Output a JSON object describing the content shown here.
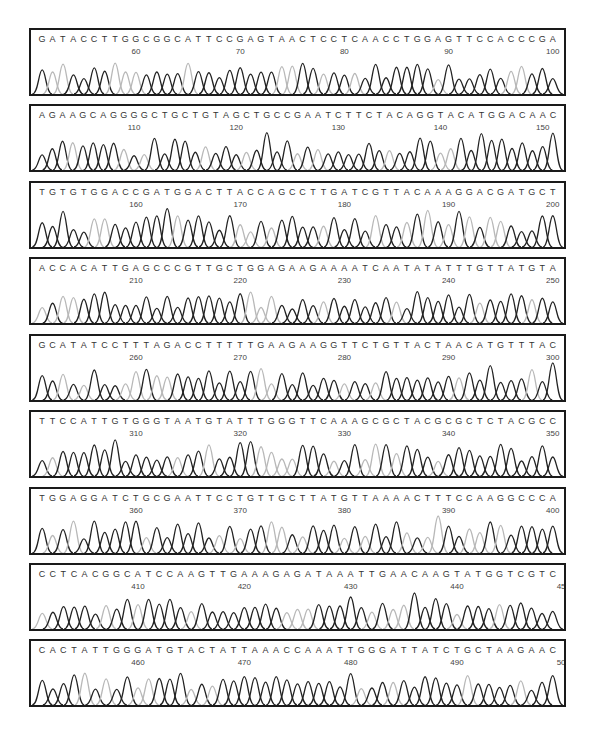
{
  "colors": {
    "dark_peak": "#222222",
    "light_peak": "#b8b8b8",
    "border": "#1a1a1a",
    "text": "#333333"
  },
  "rows": [
    {
      "seq": "GATACCTTGGCGGCATTCCGAGTAACTCCTCAACCTGGAGTTCCACCCGA",
      "ticks": [
        "60",
        "70",
        "80",
        "90",
        "100"
      ],
      "start": 51
    },
    {
      "seq": "AGAAGCAGGGGCTGCTGTAGCTGCCGAATCTTCTACAGGTACATGGACAAC",
      "ticks": [
        "110",
        "120",
        "130",
        "140",
        "150"
      ],
      "start": 101
    },
    {
      "seq": "TGTGTGGACCGATGGACTTACCAGCCTTGATCGTTACAAAGGACGATGCT",
      "ticks": [
        "160",
        "170",
        "180",
        "190",
        "200"
      ],
      "start": 151
    },
    {
      "seq": "ACCACATTGAGCCCGTTGCTGGAGAAGAAAATCAATATATTTGTTATGTA",
      "ticks": [
        "210",
        "220",
        "230",
        "240",
        "250"
      ],
      "start": 201
    },
    {
      "seq": "GCATATCCTTTAGACCTTTTTGAAGAAGGTTCTGTTACTAACATGTTTAC",
      "ticks": [
        "260",
        "270",
        "280",
        "290",
        "300"
      ],
      "start": 251
    },
    {
      "seq": "TTCCATTGTGGGTAATGTATTTGGGTTCAAAGCGCTACGCGCTCTACGCC",
      "ticks": [
        "310",
        "320",
        "330",
        "340",
        "350"
      ],
      "start": 301
    },
    {
      "seq": "TGGAGGATCTGCGAATTCCTGTTGCTTATGTTAAAACTTTCCAAGGCCCA",
      "ticks": [
        "360",
        "370",
        "380",
        "390",
        "400"
      ],
      "start": 351
    },
    {
      "seq": "CCTCACGGCATCCAAGTTGAAAGAGATAAATTGAACAAGTATGGTCGTC",
      "ticks": [
        "410",
        "420",
        "430",
        "440",
        "450"
      ],
      "start": 401
    },
    {
      "seq": "CACTATTGGGATGTACTATTAAACCAAATTGGGATTATCTGCTAAGAAC",
      "ticks": [
        "460",
        "470",
        "480",
        "490",
        "500"
      ],
      "start": 451
    }
  ]
}
